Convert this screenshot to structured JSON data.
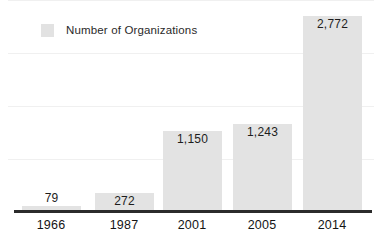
{
  "chart_data": {
    "type": "bar",
    "title": "",
    "subtitle": "",
    "xlabel": "",
    "ylabel": "",
    "categories": [
      "1966",
      "1987",
      "2001",
      "2005",
      "2014"
    ],
    "values": [
      79,
      272,
      1150,
      1243,
      2772
    ],
    "value_labels": [
      "79",
      "272",
      "1,150",
      "1,243",
      "2,772"
    ],
    "series": [
      {
        "name": "Number of Organizations",
        "values": [
          79,
          272,
          1150,
          1243,
          2772
        ]
      }
    ],
    "ylim": [
      0,
      3000
    ],
    "grid": true,
    "gridlines": [
      0,
      750,
      1500,
      2250,
      3000
    ],
    "legend": {
      "position": "top-left",
      "entries": [
        {
          "label": "Number of Organizations",
          "color": "#e3e3e3"
        }
      ]
    },
    "colors": {
      "bar": "#e3e3e3",
      "legend_swatch": "#e2e2e2",
      "gridline": "#f0f0f0",
      "axis": "#2b2b2b",
      "text": "#1b1b1b",
      "background": "#ffffff"
    },
    "bars": [
      {
        "category": "1966",
        "value": 79,
        "label": "79",
        "label_inside": false
      },
      {
        "category": "1987",
        "value": 272,
        "label": "272",
        "label_inside": true
      },
      {
        "category": "2001",
        "value": 1150,
        "label": "1,150",
        "label_inside": true
      },
      {
        "category": "2005",
        "value": 1243,
        "label": "1,243",
        "label_inside": true
      },
      {
        "category": "2014",
        "value": 2772,
        "label": "2,772",
        "label_inside": true
      }
    ]
  }
}
